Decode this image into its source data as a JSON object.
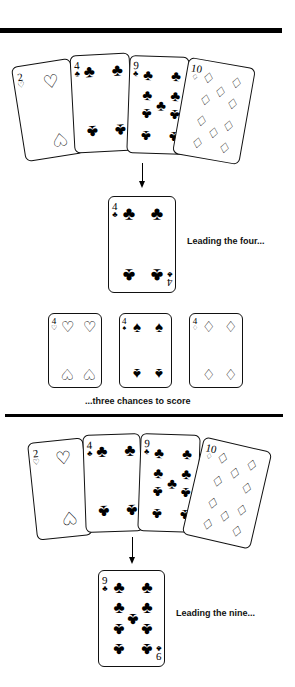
{
  "section1": {
    "hand": [
      {
        "rank": "2",
        "suit": "♡",
        "name": "two-of-hearts"
      },
      {
        "rank": "4",
        "suit": "♣",
        "name": "four-of-clubs"
      },
      {
        "rank": "9",
        "suit": "♣",
        "name": "nine-of-clubs"
      },
      {
        "rank": "10",
        "suit": "♢",
        "name": "ten-of-diamonds"
      }
    ],
    "lead_card": {
      "rank": "4",
      "suit": "♣"
    },
    "lead_caption": "Leading the four...",
    "chances": [
      {
        "rank": "4",
        "suit": "♡",
        "name": "four-of-hearts"
      },
      {
        "rank": "4",
        "suit": "♠",
        "name": "four-of-spades"
      },
      {
        "rank": "4",
        "suit": "♢",
        "name": "four-of-diamonds"
      }
    ],
    "chances_caption": "...three chances to score"
  },
  "section2": {
    "hand": [
      {
        "rank": "2",
        "suit": "♡",
        "name": "two-of-hearts"
      },
      {
        "rank": "4",
        "suit": "♣",
        "name": "four-of-clubs"
      },
      {
        "rank": "9",
        "suit": "♣",
        "name": "nine-of-clubs"
      },
      {
        "rank": "10",
        "suit": "♢",
        "name": "ten-of-diamonds"
      }
    ],
    "lead_card": {
      "rank": "9",
      "suit": "♣"
    },
    "lead_caption": "Leading the nine..."
  },
  "colors": {
    "ink": "#000000",
    "paper": "#ffffff"
  }
}
